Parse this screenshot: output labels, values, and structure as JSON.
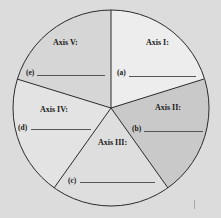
{
  "diagram": {
    "type": "five-axis pie worksheet",
    "center": [
      111,
      108
    ],
    "radius": 98,
    "colors": {
      "background": "#dcdcdc",
      "outline": "#2a2a2a",
      "axis_I_fill": "#ededed",
      "axis_II_fill": "#c9c9c9",
      "axis_III_fill": "#dedede",
      "axis_IV_fill": "#e3e3e3",
      "axis_V_fill": "#d6d6d6"
    },
    "segments": [
      {
        "id": "axis-1",
        "title": "Axis I:",
        "blank_label": "(a)",
        "answer": ""
      },
      {
        "id": "axis-2",
        "title": "Axis II:",
        "blank_label": "(b)",
        "answer": ""
      },
      {
        "id": "axis-3",
        "title": "Axis III:",
        "blank_label": "(c)",
        "answer": ""
      },
      {
        "id": "axis-4",
        "title": "Axis IV:",
        "blank_label": "(d)",
        "answer": ""
      },
      {
        "id": "axis-5",
        "title": "Axis V:",
        "blank_label": "(e)",
        "answer": ""
      }
    ]
  }
}
